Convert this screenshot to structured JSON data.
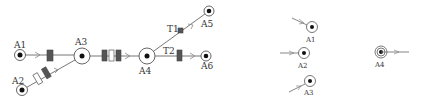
{
  "colors": {
    "line": "#777777",
    "node_stroke": "#555555",
    "node_fill": "#111111",
    "block_dark": "#555555",
    "block_light": "#ffffff"
  },
  "network": {
    "nodes": [
      {
        "id": "A1",
        "label": "A1"
      },
      {
        "id": "A2",
        "label": "A2"
      },
      {
        "id": "A3",
        "label": "A3"
      },
      {
        "id": "A4",
        "label": "A4"
      },
      {
        "id": "A5",
        "label": "A5"
      },
      {
        "id": "A6",
        "label": "A6"
      }
    ],
    "edges": [
      {
        "from": "A1",
        "to": "A3",
        "blocks": [
          "dark"
        ]
      },
      {
        "from": "A2",
        "to": "A3",
        "blocks": [
          "light",
          "dark"
        ]
      },
      {
        "from": "A3",
        "to": "A4",
        "blocks": [
          "dark",
          "light",
          "dark"
        ]
      },
      {
        "from": "A4",
        "to": "A5",
        "label": "T1",
        "blocks": [
          "small-dark"
        ]
      },
      {
        "from": "A4",
        "to": "A6",
        "label": "T2",
        "blocks": [
          "dark"
        ]
      }
    ],
    "edge_labels": {
      "t1": "T1",
      "t2": "T2"
    }
  },
  "legend": {
    "items": [
      {
        "id": "A1",
        "label": "A1",
        "arrow": "incoming-from-upper-left"
      },
      {
        "id": "A2",
        "label": "A2",
        "arrow": "incoming-from-left"
      },
      {
        "id": "A3",
        "label": "A3",
        "arrow": "incoming-from-lower-left"
      },
      {
        "id": "A4",
        "label": "A4",
        "arrow": "outgoing-to-right"
      }
    ]
  }
}
